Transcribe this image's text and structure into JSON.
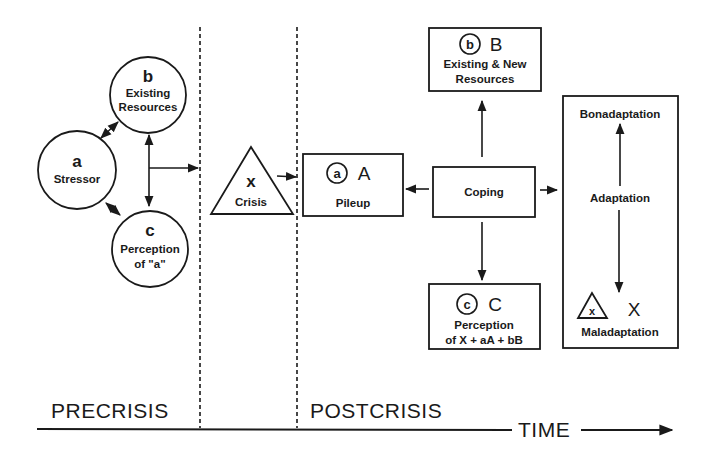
{
  "diagram": {
    "type": "family stress model (Double ABC-X)",
    "colors": {
      "ink": "#1a1a1a",
      "background": "#ffffff"
    },
    "precrisis": {
      "stressor": {
        "letter": "a",
        "label": "Stressor"
      },
      "resources": {
        "letter": "b",
        "label_line1": "Existing",
        "label_line2": "Resources"
      },
      "perception": {
        "letter": "c",
        "label_line1": "Perception",
        "label_line2": "of \"a\""
      }
    },
    "crisis": {
      "letter": "x",
      "label": "Crisis"
    },
    "postcrisis": {
      "pileup": {
        "circled": "a",
        "letter": "A",
        "label": "Pileup"
      },
      "resources": {
        "circled": "b",
        "letter": "B",
        "label_line1": "Existing & New",
        "label_line2": "Resources"
      },
      "perception": {
        "circled": "c",
        "letter": "C",
        "label_line1": "Perception",
        "label_line2": "of X + aA + bB"
      },
      "coping": {
        "label": "Coping"
      },
      "adaptation": {
        "top": "Bonadaptation",
        "middle": "Adaptation",
        "bottom": "Maladaptation",
        "triangle_letter": "x",
        "letter": "X"
      }
    },
    "timeline": {
      "phase_left": "PRECRISIS",
      "phase_right": "POSTCRISIS",
      "axis_label": "TIME"
    }
  }
}
